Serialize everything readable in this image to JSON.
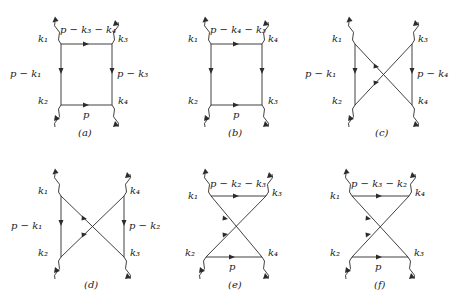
{
  "figure": {
    "title": "",
    "background": "#ffffff",
    "line_color": "#2b2b2b",
    "text_color": "#1a1a1a",
    "diagram_count": 6
  },
  "diagrams": [
    {
      "caption": "(a)",
      "topology": "box",
      "external_labels": {
        "top_left": "k₁",
        "top_right": "k₃",
        "bottom_left": "k₂",
        "bottom_right": "k₄"
      },
      "internal_labels": {
        "top": "p − k₃ − k₄",
        "left": "p − k₁",
        "right": "p − k₃",
        "bottom": "p"
      }
    },
    {
      "caption": "(b)",
      "topology": "box",
      "external_labels": {
        "top_left": "k₁",
        "top_right": "k₄",
        "bottom_left": "k₂",
        "bottom_right": "k₃"
      },
      "internal_labels": {
        "top": "p − k₄ − k₃",
        "left": "",
        "right": "",
        "bottom": "p"
      }
    },
    {
      "caption": "(c)",
      "topology": "crossed",
      "external_labels": {
        "top_left": "k₁",
        "top_right": "k₃",
        "bottom_left": "k₂",
        "bottom_right": "k₄"
      },
      "internal_labels": {
        "top": "",
        "left": "p − k₁",
        "right": "p − k₄",
        "bottom": ""
      }
    },
    {
      "caption": "(d)",
      "topology": "crossed",
      "external_labels": {
        "top_left": "k₁",
        "top_right": "k₄",
        "bottom_left": "k₂",
        "bottom_right": "k₃"
      },
      "internal_labels": {
        "top": "",
        "left": "p − k₁",
        "right": "p − k₂",
        "bottom": ""
      }
    },
    {
      "caption": "(e)",
      "topology": "bowtie",
      "external_labels": {
        "top_left": "k₁",
        "top_right": "k₃",
        "bottom_left": "k₂",
        "bottom_right": "k₄"
      },
      "internal_labels": {
        "top": "p − k₂ − k₃",
        "left": "",
        "right": "",
        "bottom": "p"
      }
    },
    {
      "caption": "(f)",
      "topology": "bowtie",
      "external_labels": {
        "top_left": "k₁",
        "top_right": "k₄",
        "bottom_left": "k₂",
        "bottom_right": "k₃"
      },
      "internal_labels": {
        "top": "p − k₃ − k₂",
        "left": "",
        "right": "",
        "bottom": "p"
      }
    }
  ]
}
